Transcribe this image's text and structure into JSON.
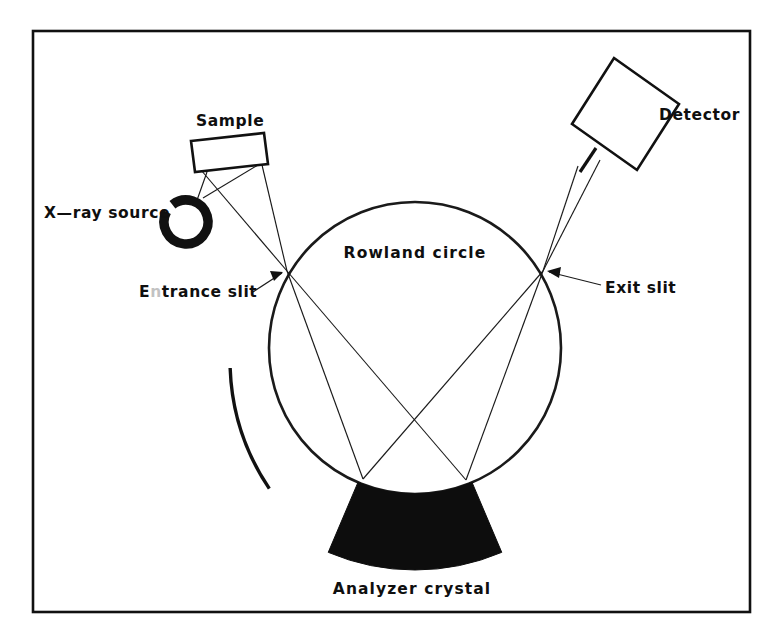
{
  "figure": {
    "kind": "schematic-diagram",
    "background_color": "#ffffff",
    "ink_color": "#111111",
    "frame": {
      "x": 33,
      "y": 31,
      "width": 717,
      "height": 581,
      "stroke_color": "#111111"
    }
  },
  "labels": {
    "sample": "Sample",
    "xray_source": "X—ray source",
    "entrance_slit": "Entrance slit",
    "entrance_slit_prefix": "E",
    "entrance_slit_faded_letter": "n",
    "entrance_slit_suffix": "trance  slit",
    "rowland_circle": "Rowland  circle",
    "exit_slit": "Exit slit",
    "detector": "Detector",
    "analyzer_crystal": "Analyzer  crystal"
  },
  "geometry": {
    "rowland_circle": {
      "center_x": 415,
      "center_y": 348,
      "radius": 146,
      "stroke_color": "#1a1a1a"
    },
    "entrance_slit_node": {
      "x": 287,
      "y": 271
    },
    "exit_slit_node": {
      "x": 543,
      "y": 271
    },
    "crystal_left_edge": {
      "x": 309,
      "y": 481
    },
    "crystal_right_edge": {
      "x": 516,
      "y": 481
    },
    "crystal_inner_radius": 146,
    "crystal_outer_radius": 222,
    "crystal_half_angle_deg": 23,
    "source_ring": {
      "center_x": 186,
      "center_y": 222,
      "radius": 22,
      "stroke_width": 9.5,
      "gap_start_deg": -62,
      "gap_end_deg": -38
    },
    "sample_box": {
      "corners": "191,141 264,133 268,164 195,172"
    },
    "detector_box": {
      "corners": "614,58 679,104 637,170 572,124"
    },
    "detector_stem": {
      "x1": 596,
      "y1": 148,
      "x2": 580,
      "y2": 172
    },
    "collimator_arc": {
      "cx": 460,
      "cy": 360,
      "radius": 230,
      "start_deg": -124,
      "end_deg": -92
    }
  },
  "ray_paths": {
    "source_to_sample": [
      {
        "name": "source-to-sample-left",
        "x1": 196,
        "y1": 203,
        "x2": 207,
        "y2": 172
      },
      {
        "name": "source-to-sample-right",
        "x1": 203,
        "y1": 198,
        "x2": 258,
        "y2": 165
      }
    ],
    "sample_to_entrance_slit": [
      {
        "name": "sample-left-corner-to-entrance-slit",
        "x1": 201,
        "y1": 170,
        "x2": 287,
        "y2": 271
      },
      {
        "name": "sample-right-corner-to-entrance-slit",
        "x1": 262,
        "y1": 165,
        "x2": 287,
        "y2": 271
      }
    ],
    "entrance_slit_to_crystal": [
      {
        "name": "entrance-slit-to-crystal-left",
        "x1": 287,
        "y1": 271,
        "x2": 363,
        "y2": 479
      },
      {
        "name": "entrance-slit-to-crystal-right",
        "x1": 287,
        "y1": 271,
        "x2": 466,
        "y2": 480
      }
    ],
    "crystal_to_exit_slit": [
      {
        "name": "crystal-left-to-exit-slit",
        "x1": 363,
        "y1": 479,
        "x2": 543,
        "y2": 271
      },
      {
        "name": "crystal-right-to-exit-slit",
        "x1": 466,
        "y1": 480,
        "x2": 543,
        "y2": 271
      }
    ],
    "exit_slit_to_detector": [
      {
        "name": "exit-slit-to-detector-left",
        "x1": 543,
        "y1": 271,
        "x2": 578,
        "y2": 166
      },
      {
        "name": "exit-slit-to-detector-right",
        "x1": 543,
        "y1": 271,
        "x2": 600,
        "y2": 160
      }
    ]
  },
  "leaders": [
    {
      "name": "entrance-slit-leader",
      "x1": 253,
      "y1": 292,
      "x2": 282,
      "y2": 273,
      "head_points": "283,272 270,271 274,281"
    },
    {
      "name": "exit-slit-leader",
      "x1": 601,
      "y1": 285,
      "x2": 549,
      "y2": 272,
      "head_points": "547,271 561,267 559,278"
    }
  ],
  "label_positions": {
    "sample": {
      "x": 196,
      "y": 126,
      "anchor": "start"
    },
    "xray_source": {
      "x": 44,
      "y": 218,
      "anchor": "start"
    },
    "entrance_slit": {
      "x": 139,
      "y": 297,
      "anchor": "start"
    },
    "rowland_circle": {
      "x": 415,
      "y": 258,
      "anchor": "middle"
    },
    "exit_slit": {
      "x": 605,
      "y": 293,
      "anchor": "start"
    },
    "detector": {
      "x": 659,
      "y": 120,
      "anchor": "start"
    },
    "analyzer_crystal": {
      "x": 412,
      "y": 594,
      "anchor": "middle"
    }
  }
}
